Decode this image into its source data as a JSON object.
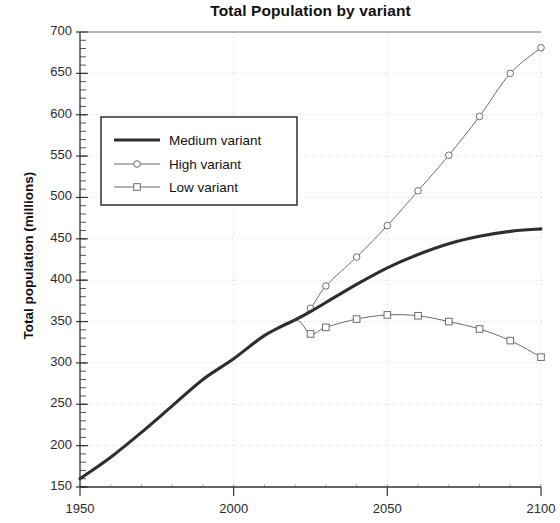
{
  "chart_data": {
    "type": "line",
    "title": "Total Population by variant",
    "xlabel": "",
    "ylabel": "Total population (millions)",
    "xlim": [
      1950,
      2100
    ],
    "ylim": [
      150,
      700
    ],
    "xticks": [
      1950,
      2000,
      2050,
      2100
    ],
    "yticks": [
      150,
      200,
      250,
      300,
      350,
      400,
      450,
      500,
      550,
      600,
      650,
      700
    ],
    "grid": true,
    "minor_ticks": true,
    "legend_position": "upper-left-inside",
    "series": [
      {
        "name": "Medium variant",
        "style": "thick-solid",
        "marker": "none",
        "color": "#2e2e2e",
        "x": [
          1950,
          1960,
          1970,
          1980,
          1990,
          2000,
          2010,
          2020,
          2025,
          2030,
          2040,
          2050,
          2060,
          2070,
          2080,
          2090,
          2100
        ],
        "y": [
          160,
          186,
          216,
          248,
          280,
          305,
          333,
          352,
          362,
          373,
          395,
          415,
          431,
          444,
          453,
          459,
          462
        ]
      },
      {
        "name": "High variant",
        "style": "thin-solid",
        "marker": "circle",
        "color": "#6b6b6b",
        "x": [
          1950,
          1960,
          1970,
          1980,
          1990,
          2000,
          2010,
          2020,
          2025,
          2030,
          2040,
          2050,
          2060,
          2070,
          2080,
          2090,
          2100
        ],
        "y": [
          160,
          186,
          216,
          248,
          280,
          305,
          333,
          352,
          366,
          393,
          428,
          466,
          508,
          551,
          598,
          650,
          681
        ]
      },
      {
        "name": "Low variant",
        "style": "thin-solid",
        "marker": "square",
        "color": "#6b6b6b",
        "x": [
          1950,
          1960,
          1970,
          1980,
          1990,
          2000,
          2010,
          2020,
          2025,
          2030,
          2040,
          2050,
          2060,
          2070,
          2080,
          2090,
          2100
        ],
        "y": [
          160,
          186,
          216,
          248,
          280,
          305,
          333,
          352,
          335,
          343,
          353,
          358,
          357,
          350,
          341,
          327,
          307
        ]
      }
    ]
  },
  "legend": {
    "items": [
      {
        "label": "Medium variant"
      },
      {
        "label": "High variant"
      },
      {
        "label": "Low variant"
      }
    ]
  },
  "axes": {
    "y_labels": [
      "700",
      "650",
      "600",
      "550",
      "500",
      "450",
      "400",
      "350",
      "300",
      "250",
      "200",
      "150"
    ],
    "x_labels": [
      "1950",
      "2000",
      "2050",
      "2100"
    ]
  }
}
